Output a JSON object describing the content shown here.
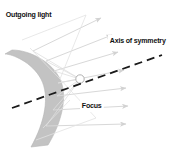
{
  "figure": {
    "background_color": "#ffffff",
    "width": 186,
    "height": 155
  },
  "labels": {
    "outgoing_light": "Outgoing light",
    "axis_of_symmetry": "Axis of symmetry",
    "focus": "Focus"
  },
  "colors": {
    "mirror_fill": "#c3c3c3",
    "mirror_edge": "#b2b2b2",
    "ray": "#d8d8d8",
    "ray_dark": "#cfcfcf",
    "axis_dash": "#1a1a1a",
    "focus_stroke": "#9a9a9a",
    "text": "#111111",
    "background": "#ffffff"
  },
  "diagram": {
    "mirror_shape": "convex-crescent",
    "focus_point": {
      "x": 80,
      "y": 79
    },
    "axis": {
      "x1": 12,
      "y1": 108,
      "x2": 162,
      "y2": 55,
      "style": "dashed"
    },
    "ray_count": 8,
    "ray_direction": "up-right",
    "arrowheads": true
  }
}
